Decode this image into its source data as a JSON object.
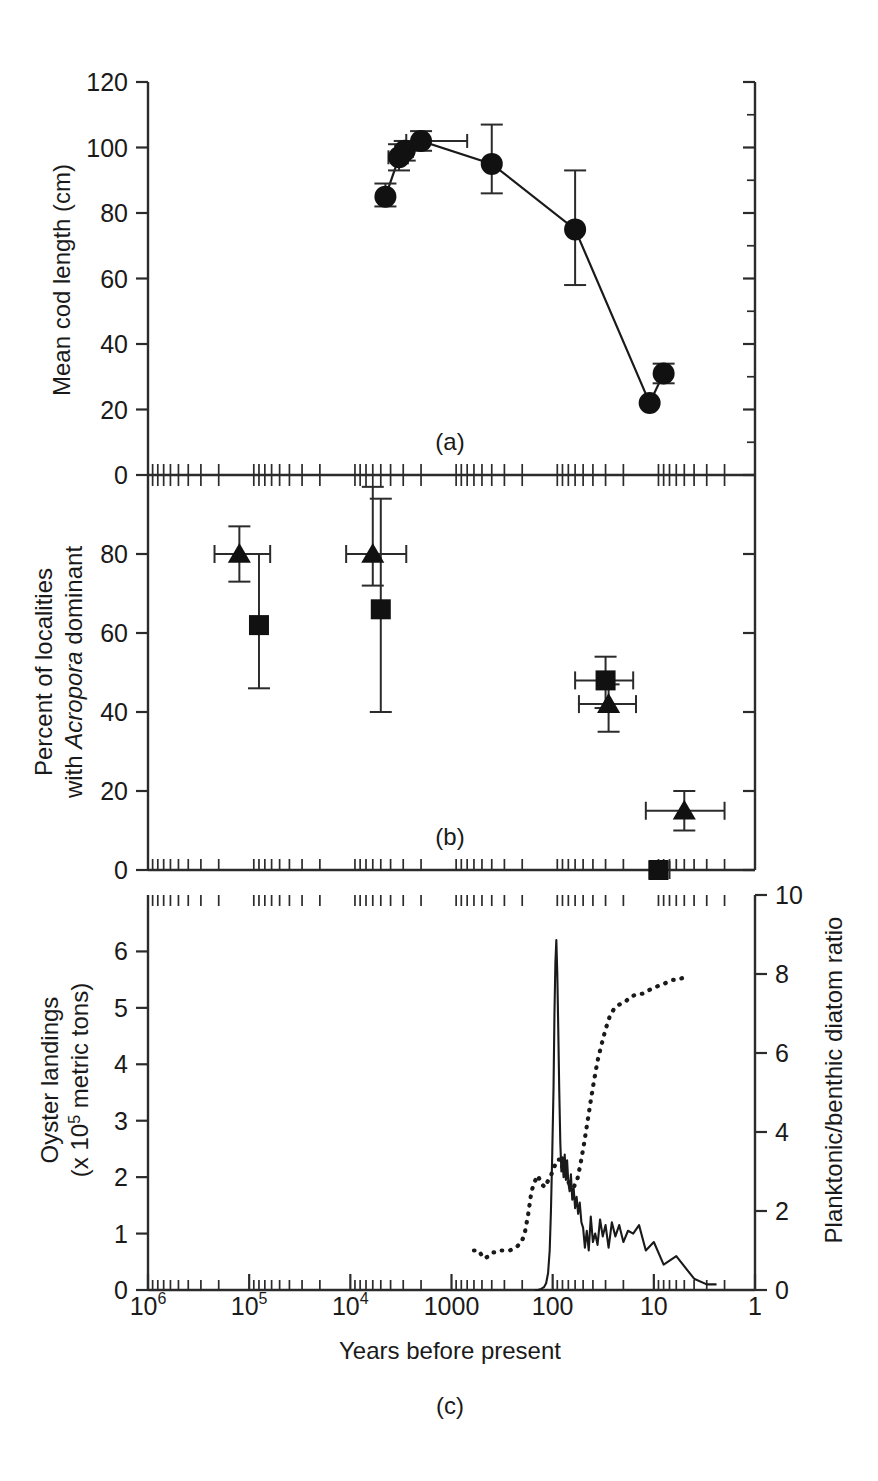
{
  "figure": {
    "x_axis": {
      "label": "Years before present",
      "scale": "log-reversed",
      "tick_labels": [
        "10",
        "10",
        "10",
        "1000",
        "100",
        "10",
        "1"
      ],
      "tick_main": [
        {
          "text": "10",
          "sup": "6",
          "value": 1000000
        },
        {
          "text": "10",
          "sup": "5",
          "value": 100000
        },
        {
          "text": "10",
          "sup": "4",
          "value": 10000
        },
        {
          "text": "1000",
          "sup": "",
          "value": 1000
        },
        {
          "text": "100",
          "sup": "",
          "value": 100
        },
        {
          "text": "10",
          "sup": "",
          "value": 10
        },
        {
          "text": "1",
          "sup": "",
          "value": 1
        }
      ]
    },
    "panels": [
      {
        "id": "a",
        "label": "(a)",
        "y_label": "Mean cod length (cm)",
        "y_ticks": [
          "0",
          "20",
          "40",
          "60",
          "80",
          "100",
          "120"
        ],
        "y_min": 0,
        "y_max": 120
      },
      {
        "id": "b",
        "label": "(b)",
        "y_label_line1": "Percent of localities",
        "y_label_line2_pre": "with ",
        "y_label_line2_italic": "Acropora",
        "y_label_line2_post": " dominant",
        "y_ticks": [
          "0",
          "20",
          "40",
          "60",
          "80"
        ],
        "y_min": 0,
        "y_max": 100
      },
      {
        "id": "c",
        "label": "(c)",
        "y_label_line1": "Oyster landings",
        "y_label_line2_pre": "(x 10",
        "y_label_line2_sup": "5",
        "y_label_line2_post": " metric tons)",
        "y_ticks": [
          "0",
          "1",
          "2",
          "3",
          "4",
          "5",
          "6"
        ],
        "y_min": 0,
        "y_max": 7,
        "y2_label": "Planktonic/benthic diatom ratio",
        "y2_ticks": [
          "0",
          "2",
          "4",
          "6",
          "8",
          "10"
        ],
        "y2_min": 0,
        "y2_max": 10
      }
    ]
  },
  "chart_data": [
    {
      "type": "scatter",
      "panel": "a",
      "title": "(a)",
      "xlabel": "Years before present",
      "ylabel": "Mean cod length (cm)",
      "xlim": [
        1000000,
        1
      ],
      "xscale": "log-reversed",
      "ylim": [
        0,
        120
      ],
      "grid": false,
      "legend": "none",
      "marker": "circle",
      "connected": true,
      "points": [
        {
          "x": 4500,
          "y": 85,
          "yerr_low": 82,
          "yerr_high": 89,
          "xerr_low": null,
          "xerr_high": null
        },
        {
          "x": 3300,
          "y": 97,
          "yerr_low": 93,
          "yerr_high": 101,
          "xerr_low": 4200,
          "xerr_high": 2700
        },
        {
          "x": 2900,
          "y": 99,
          "yerr_low": 96,
          "yerr_high": 102,
          "xerr_low": 3600,
          "xerr_high": 2400
        },
        {
          "x": 2000,
          "y": 102,
          "yerr_low": 99,
          "yerr_high": 105,
          "xerr_low": 2800,
          "xerr_high": 700
        },
        {
          "x": 400,
          "y": 95,
          "yerr_low": 86,
          "yerr_high": 107,
          "xerr_low": null,
          "xerr_high": null
        },
        {
          "x": 60,
          "y": 75,
          "yerr_low": 58,
          "yerr_high": 93,
          "xerr_low": null,
          "xerr_high": null
        },
        {
          "x": 11,
          "y": 22,
          "yerr_low": 22,
          "yerr_high": 22,
          "xerr_low": null,
          "xerr_high": null
        },
        {
          "x": 8,
          "y": 31,
          "yerr_low": 28,
          "yerr_high": 34,
          "xerr_low": 9,
          "xerr_high": 7
        }
      ]
    },
    {
      "type": "scatter",
      "panel": "b",
      "title": "(b)",
      "xlabel": "Years before present",
      "ylabel": "Percent of localities with Acropora dominant",
      "xlim": [
        1000000,
        1
      ],
      "xscale": "log-reversed",
      "ylim": [
        0,
        100
      ],
      "grid": false,
      "legend": "none",
      "series": [
        {
          "name": "triangle",
          "marker": "triangle",
          "points": [
            {
              "x": 125000,
              "y": 80,
              "yerr_low": 73,
              "yerr_high": 87,
              "xerr_low": 220000,
              "xerr_high": 62000
            },
            {
              "x": 6000,
              "y": 80,
              "yerr_low": 72,
              "yerr_high": 97,
              "xerr_low": 11000,
              "xerr_high": 2800
            },
            {
              "x": 28,
              "y": 42,
              "yerr_low": 35,
              "yerr_high": 47,
              "xerr_low": 55,
              "xerr_high": 15
            },
            {
              "x": 5,
              "y": 15,
              "yerr_low": 10,
              "yerr_high": 20,
              "xerr_low": 12,
              "xerr_high": 2
            }
          ]
        },
        {
          "name": "square",
          "marker": "square",
          "points": [
            {
              "x": 80000,
              "y": 62,
              "yerr_low": 46,
              "yerr_high": 80,
              "xerr_low": 85000,
              "xerr_high": 72000
            },
            {
              "x": 5000,
              "y": 66,
              "yerr_low": 40,
              "yerr_high": 94,
              "xerr_low": 5600,
              "xerr_high": 4300
            },
            {
              "x": 30,
              "y": 48,
              "yerr_low": 41,
              "yerr_high": 54,
              "xerr_low": 60,
              "xerr_high": 16
            },
            {
              "x": 9,
              "y": 0,
              "yerr_low": 0,
              "yerr_high": 0,
              "xerr_low": 11,
              "xerr_high": 7
            }
          ]
        }
      ]
    },
    {
      "type": "line",
      "panel": "c",
      "title": "(c)",
      "xlabel": "Years before present",
      "ylabel": "Oyster landings (x 10^5 metric tons)",
      "y2label": "Planktonic/benthic diatom ratio",
      "xlim": [
        1000000,
        1
      ],
      "xscale": "log-reversed",
      "ylim": [
        0,
        7
      ],
      "y2lim": [
        0,
        10
      ],
      "grid": false,
      "legend": "none",
      "series": [
        {
          "name": "Oyster landings",
          "style": "solid",
          "axis": "left",
          "x": [
            150,
            140,
            130,
            122,
            116,
            111,
            107,
            104,
            101,
            98,
            96,
            94,
            92,
            90,
            88,
            86,
            84,
            82,
            80,
            78,
            76,
            74,
            72,
            70,
            68,
            66,
            64,
            62,
            60,
            58,
            56,
            54,
            52,
            50,
            48,
            46,
            44,
            42,
            40,
            38,
            36,
            34,
            32,
            30,
            28,
            26,
            24,
            22,
            20,
            18,
            16,
            14,
            12,
            10,
            8,
            6,
            4,
            3,
            2.4
          ],
          "y": [
            0.0,
            0.0,
            0.02,
            0.05,
            0.12,
            0.3,
            0.7,
            1.4,
            2.4,
            3.6,
            4.9,
            5.8,
            6.2,
            5.6,
            4.6,
            3.5,
            2.6,
            2.1,
            2.35,
            2.0,
            2.4,
            1.95,
            2.3,
            1.9,
            1.75,
            2.05,
            1.6,
            1.8,
            1.45,
            1.65,
            1.35,
            1.55,
            1.2,
            1.1,
            0.75,
            1.05,
            0.7,
            1.3,
            0.85,
            1.0,
            0.8,
            1.25,
            0.95,
            1.15,
            0.75,
            1.2,
            0.95,
            1.15,
            0.85,
            1.05,
            1.0,
            1.15,
            0.7,
            0.85,
            0.45,
            0.6,
            0.2,
            0.1,
            0.1
          ]
        },
        {
          "name": "Planktonic/benthic diatom ratio",
          "style": "dotted",
          "axis": "right",
          "x": [
            600,
            540,
            480,
            430,
            390,
            350,
            320,
            290,
            265,
            245,
            225,
            205,
            190,
            175,
            162,
            150,
            140,
            130,
            120,
            112,
            104,
            97,
            90,
            84,
            78,
            72,
            67,
            62,
            57,
            53,
            49,
            45,
            42,
            39,
            36,
            33,
            30,
            27.5,
            25,
            23,
            21,
            19,
            17.5,
            16,
            14.5,
            13,
            12,
            11,
            10,
            9,
            8,
            7.2,
            6.5,
            5.8,
            5.2
          ],
          "y": [
            1.0,
            1.0,
            0.8,
            0.85,
            0.95,
            0.95,
            1.0,
            1.0,
            1.0,
            1.05,
            1.1,
            1.2,
            1.4,
            1.9,
            2.5,
            2.75,
            2.9,
            2.7,
            2.6,
            2.75,
            2.9,
            3.1,
            3.3,
            3.3,
            3.0,
            2.8,
            2.65,
            2.6,
            2.8,
            3.2,
            3.7,
            4.3,
            4.8,
            5.3,
            5.8,
            6.2,
            6.6,
            6.9,
            7.1,
            7.2,
            7.25,
            7.3,
            7.4,
            7.45,
            7.5,
            7.5,
            7.55,
            7.6,
            7.65,
            7.7,
            7.75,
            7.8,
            7.85,
            7.85,
            7.9
          ]
        }
      ]
    }
  ]
}
